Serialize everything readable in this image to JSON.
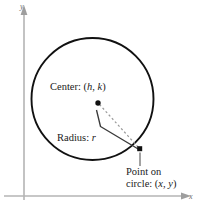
{
  "figure": {
    "background": "#ffffff",
    "width": 200,
    "height": 211
  },
  "axes": {
    "color": "#b4b4b4",
    "x_label": "x",
    "y_label": "y",
    "x_axis_y": 196,
    "y_axis_x": 24
  },
  "labels": {
    "center": {
      "prefix": "Center: (",
      "var1": "h",
      "sep": ", ",
      "var2": "k",
      "suffix": ")",
      "text": "Center: (h, k)"
    },
    "radius": {
      "prefix": "Radius: ",
      "var": "r",
      "text": "Radius: r"
    },
    "point": {
      "line1": "Point on",
      "prefix": "circle: (",
      "var1": "x",
      "sep": ", ",
      "var2": "y",
      "suffix": ")",
      "text": "Point on circle: (x, y)"
    }
  },
  "geometry": {
    "circle": {
      "cx": 92.5,
      "cy": 99,
      "r": 61,
      "stroke": "#111111",
      "stroke_width": 1.8,
      "fill": "none"
    },
    "center_point": {
      "cx": 98,
      "cy": 103,
      "size": 4.6,
      "fill": "#111111"
    },
    "circle_point": {
      "cx": 139.5,
      "cy": 148.5,
      "size": 4.6,
      "fill": "#111111"
    },
    "radius_dashed": {
      "x1": 99,
      "y1": 104,
      "x2": 138,
      "y2": 147,
      "stroke": "#9a9a9a",
      "dash": "2.2 2.4"
    },
    "radius_leader": {
      "points": "96,110 100,126 139,149",
      "stroke": "#3a3a3a"
    },
    "point_leader": {
      "x1": 140,
      "y1": 152,
      "x2": 140,
      "y2": 166,
      "stroke": "#6a6a6a"
    }
  },
  "colors": {
    "ink": "#111111",
    "axis": "#b4b4b4",
    "dash": "#9a9a9a",
    "leader": "#3a3a3a",
    "text": "#1a1a1a"
  }
}
